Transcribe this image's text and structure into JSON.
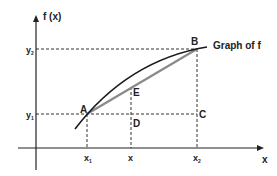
{
  "diagram": {
    "axes": {
      "y_label": "f (x)",
      "x_label": "x"
    },
    "curve_label": "Graph of f",
    "points": {
      "A": "A",
      "B": "B",
      "C": "C",
      "D": "D",
      "E": "E"
    },
    "x_ticks": {
      "x1": "x",
      "x1_sub": "1",
      "x": "x",
      "x2": "x",
      "x2_sub": "2"
    },
    "y_ticks": {
      "y1": "y",
      "y1_sub": "1",
      "y2": "y",
      "y2_sub": "2"
    },
    "colors": {
      "curve": "#1a1a1a",
      "chord": "#8a8a8a",
      "axes": "#222222",
      "dashed": "#333333"
    }
  }
}
